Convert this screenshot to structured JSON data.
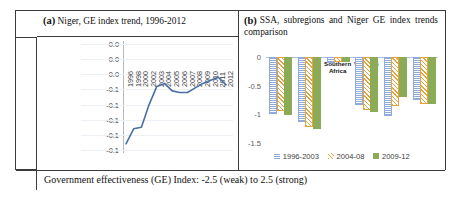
{
  "figure": {
    "caption": "Government effectiveness (GE) Index: -2.5 (weak) to 2.5 (strong)",
    "panel_a_marker": "(a)",
    "panel_b_marker": "(b)",
    "y_axis_strip_label": "GE index"
  },
  "panel_a": {
    "title": "Niger, GE index trend, 1996-2012"
  },
  "panel_b": {
    "title": "SSA, subregions and Niger GE index trends comparison"
  },
  "colors": {
    "series_1996_2003": "#8faadc",
    "series_2004_08": "#e8a33d",
    "series_2009_12": "#8bab56",
    "line_color": "#4a6persist",
    "trend_line": "#4a6fa5",
    "gridline": "#eceff3",
    "border": "#3c3c3c"
  },
  "chart_data": [
    {
      "type": "line",
      "title": "Niger, GE index trend, 1996-2012",
      "xlabel": "",
      "ylabel": "GE index",
      "x": [
        "1996",
        "1998",
        "2000",
        "2002",
        "2003",
        "2004",
        "2005",
        "2006",
        "2007",
        "2008",
        "2009",
        "2010",
        "2011",
        "2012"
      ],
      "ytick_labels": [
        "0.0",
        "0.0",
        "0.0",
        "-0.1",
        "-0.1",
        "-0.1",
        "-0.1",
        "-0.1"
      ],
      "ylim": [
        -0.82,
        -0.12
      ],
      "grid": true,
      "series": [
        {
          "name": "Niger GE index",
          "color": "#4a6fa5",
          "values": [
            -0.78,
            -0.68,
            -0.67,
            -0.52,
            -0.4,
            -0.38,
            -0.43,
            -0.44,
            -0.44,
            -0.41,
            -0.38,
            -0.36,
            -0.34,
            -0.39
          ]
        }
      ]
    },
    {
      "type": "bar",
      "title": "SSA, subregions and Niger GE index trends comparison",
      "xlabel": "",
      "ylabel": "",
      "categories": [
        "Central Africa",
        "Eastern Africa",
        "Southern Africa",
        "Western Africa",
        "Niger",
        "SSA"
      ],
      "ytick_labels": [
        "0",
        "-0.5",
        "-1",
        "-1.5"
      ],
      "ylim": [
        -1.5,
        0
      ],
      "grid": false,
      "legend_position": "bottom",
      "series": [
        {
          "name": "1996-2003",
          "color": "#8faadc",
          "pattern": "checker",
          "values": [
            -0.95,
            -1.1,
            -0.07,
            -0.8,
            -1.0,
            -0.72
          ]
        },
        {
          "name": "2004-08",
          "color": "#e8a33d",
          "pattern": "diagonal",
          "values": [
            -0.9,
            -1.18,
            -0.05,
            -0.88,
            -0.82,
            -0.78
          ]
        },
        {
          "name": "2009-12",
          "color": "#8bab56",
          "pattern": "solid",
          "values": [
            -0.98,
            -1.22,
            -0.06,
            -0.92,
            -0.67,
            -0.78
          ]
        }
      ]
    }
  ]
}
